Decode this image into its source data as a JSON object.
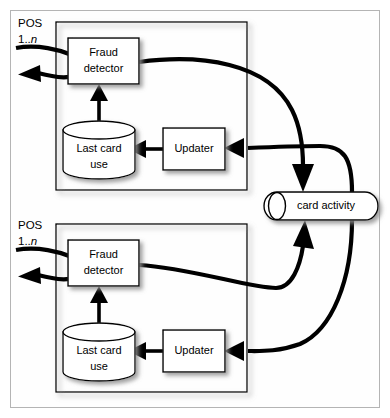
{
  "diagram": {
    "type": "component-diagram",
    "colors": {
      "background": "#ffffff",
      "frame_border": "#b4b4b4",
      "node_stroke": "#000000",
      "node_fill": "#ffffff",
      "flow_stroke": "#000000",
      "shadow": "#9a9a9a"
    },
    "pos_units": [
      {
        "id": "pos-top",
        "multiplicity_line1": "POS",
        "multiplicity_line2_prefix": "1..",
        "multiplicity_line2_italic": "n",
        "components": [
          {
            "id": "fraud-detector-top",
            "label_line1": "Fraud",
            "label_line2": "detector",
            "shape": "rectangle"
          },
          {
            "id": "last-card-use-top",
            "label_line1": "Last card",
            "label_line2": "use",
            "shape": "cylinder"
          },
          {
            "id": "updater-top",
            "label_line1": "Updater",
            "label_line2": "",
            "shape": "rectangle"
          }
        ]
      },
      {
        "id": "pos-bottom",
        "multiplicity_line1": "POS",
        "multiplicity_line2_prefix": "1..",
        "multiplicity_line2_italic": "n",
        "components": [
          {
            "id": "fraud-detector-bottom",
            "label_line1": "Fraud",
            "label_line2": "detector",
            "shape": "rectangle"
          },
          {
            "id": "last-card-use-bottom",
            "label_line1": "Last card",
            "label_line2": "use",
            "shape": "cylinder"
          },
          {
            "id": "updater-bottom",
            "label_line1": "Updater",
            "label_line2": "",
            "shape": "rectangle"
          }
        ]
      }
    ],
    "shared_channel": {
      "id": "card-activity",
      "label": "card activity",
      "shape": "queue"
    },
    "connections": [
      {
        "from": "external",
        "to": "fraud-detector-top",
        "style": "curved"
      },
      {
        "from": "fraud-detector-top",
        "to": "external",
        "style": "curved-arrow"
      },
      {
        "from": "last-card-use-top",
        "to": "fraud-detector-top",
        "style": "straight-arrow"
      },
      {
        "from": "updater-top",
        "to": "last-card-use-top",
        "style": "straight-arrow"
      },
      {
        "from": "fraud-detector-top",
        "to": "card-activity",
        "style": "curved-arrow"
      },
      {
        "from": "card-activity",
        "to": "updater-top",
        "style": "curved-arrow"
      },
      {
        "from": "external",
        "to": "fraud-detector-bottom",
        "style": "curved"
      },
      {
        "from": "fraud-detector-bottom",
        "to": "external",
        "style": "curved-arrow"
      },
      {
        "from": "last-card-use-bottom",
        "to": "fraud-detector-bottom",
        "style": "straight-arrow"
      },
      {
        "from": "updater-bottom",
        "to": "last-card-use-bottom",
        "style": "straight-arrow"
      },
      {
        "from": "fraud-detector-bottom",
        "to": "card-activity",
        "style": "curved-arrow"
      },
      {
        "from": "card-activity",
        "to": "updater-bottom",
        "style": "curved-arrow"
      }
    ]
  }
}
